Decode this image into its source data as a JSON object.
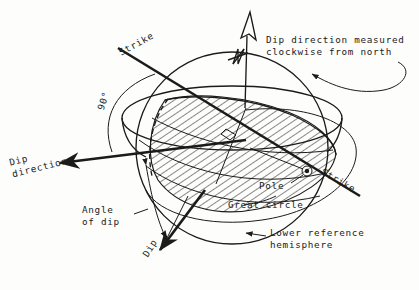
{
  "figure": {
    "background_color": "#fdfdfb",
    "ink_color": "#1b1b1b",
    "style": "hand-drawn line diagram"
  },
  "labels": {
    "strike_upper": "Strike",
    "strike_lower": "Strike",
    "angle_90": "90°",
    "dip_direction": "Dip\ndirection",
    "angle_of_dip": "Angle\nof dip",
    "dip": "Dip",
    "pole": "Pole",
    "great_circle": "Great circle",
    "lower_hemisphere": "Lower reference\nhemisphere",
    "dip_direction_note_line1": "Dip direction measured",
    "dip_direction_note_line2": "clockwise from north",
    "north_letter": "N"
  },
  "elements": {
    "north_arrow": "north-arrow-icon",
    "pole_marker": "pole-point-icon",
    "hatched_plane": "dipping-plane-hatched",
    "reference_sphere": "lower-reference-hemisphere",
    "horizontal_ellipse": "horizontal-reference-plane",
    "clockwise_sweep": "clockwise-sweep-arrow"
  }
}
